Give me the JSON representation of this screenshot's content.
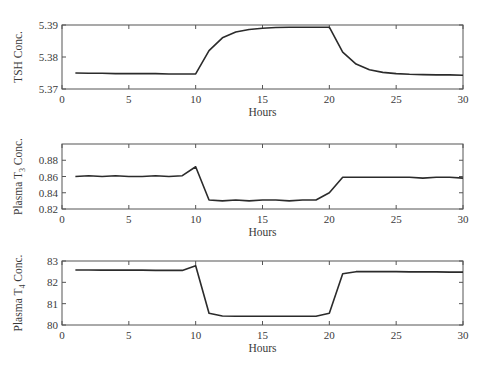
{
  "chart_data": [
    {
      "type": "line",
      "title": "",
      "xlabel": "Hours",
      "ylabel": "TSH Conc.",
      "ylabel_subscript": "",
      "xlim": [
        0,
        30
      ],
      "ylim": [
        5.37,
        5.39
      ],
      "xticks": [
        0,
        5,
        10,
        15,
        20,
        25,
        30
      ],
      "yticks": [
        5.37,
        5.38,
        5.39
      ],
      "ytick_labels": [
        "5.37",
        "5.38",
        "5.39"
      ],
      "grid": false,
      "series": [
        {
          "name": "TSH",
          "x": [
            1,
            2,
            3,
            4,
            5,
            6,
            7,
            8,
            9,
            10,
            11,
            12,
            13,
            14,
            15,
            16,
            17,
            18,
            19,
            20,
            21,
            22,
            23,
            24,
            25,
            26,
            27,
            28,
            29,
            30
          ],
          "y": [
            5.375,
            5.3749,
            5.3749,
            5.3748,
            5.3748,
            5.3748,
            5.3748,
            5.3747,
            5.3747,
            5.3747,
            5.382,
            5.386,
            5.3878,
            5.3886,
            5.389,
            5.3892,
            5.3893,
            5.3893,
            5.3893,
            5.3893,
            5.3815,
            5.3778,
            5.376,
            5.3752,
            5.3748,
            5.3746,
            5.3745,
            5.3744,
            5.3744,
            5.3743
          ]
        }
      ]
    },
    {
      "type": "line",
      "title": "",
      "xlabel": "Hours",
      "ylabel": "Plasma T",
      "ylabel_subscript": "3",
      "ylabel_suffix": " Conc.",
      "xlim": [
        0,
        30
      ],
      "ylim": [
        0.82,
        0.9
      ],
      "xticks": [
        0,
        5,
        10,
        15,
        20,
        25,
        30
      ],
      "yticks": [
        0.82,
        0.84,
        0.86,
        0.88
      ],
      "ytick_labels": [
        "0.82",
        "0.84",
        "0.86",
        "0.88"
      ],
      "grid": false,
      "series": [
        {
          "name": "Plasma T3",
          "x": [
            1,
            2,
            3,
            4,
            5,
            6,
            7,
            8,
            9,
            10,
            11,
            12,
            13,
            14,
            15,
            16,
            17,
            18,
            19,
            20,
            21,
            22,
            23,
            24,
            25,
            26,
            27,
            28,
            29,
            30
          ],
          "y": [
            0.86,
            0.861,
            0.86,
            0.861,
            0.86,
            0.86,
            0.861,
            0.86,
            0.861,
            0.872,
            0.831,
            0.83,
            0.831,
            0.83,
            0.831,
            0.831,
            0.83,
            0.831,
            0.831,
            0.84,
            0.859,
            0.859,
            0.859,
            0.859,
            0.859,
            0.859,
            0.858,
            0.859,
            0.859,
            0.858
          ]
        }
      ]
    },
    {
      "type": "line",
      "title": "",
      "xlabel": "Hours",
      "ylabel": "Plasma T",
      "ylabel_subscript": "4",
      "ylabel_suffix": " Conc.",
      "xlim": [
        0,
        30
      ],
      "ylim": [
        80,
        83
      ],
      "xticks": [
        0,
        5,
        10,
        15,
        20,
        25,
        30
      ],
      "yticks": [
        80,
        81,
        82,
        83
      ],
      "ytick_labels": [
        "80",
        "81",
        "82",
        "83"
      ],
      "grid": false,
      "series": [
        {
          "name": "Plasma T4",
          "x": [
            1,
            2,
            3,
            4,
            5,
            6,
            7,
            8,
            9,
            10,
            11,
            12,
            13,
            14,
            15,
            16,
            17,
            18,
            19,
            20,
            21,
            22,
            23,
            24,
            25,
            26,
            27,
            28,
            29,
            30
          ],
          "y": [
            82.58,
            82.58,
            82.57,
            82.57,
            82.57,
            82.57,
            82.56,
            82.56,
            82.56,
            82.78,
            80.55,
            80.42,
            80.41,
            80.41,
            80.41,
            80.41,
            80.41,
            80.41,
            80.41,
            80.55,
            82.4,
            82.5,
            82.5,
            82.5,
            82.5,
            82.49,
            82.49,
            82.49,
            82.48,
            82.48
          ]
        }
      ]
    }
  ]
}
